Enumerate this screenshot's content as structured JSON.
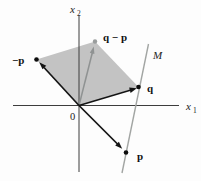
{
  "figure": {
    "labels": {
      "axis_x1": {
        "base": "x",
        "sub": "1"
      },
      "axis_x2": {
        "base": "x",
        "sub": "2"
      },
      "origin": "0",
      "line_m": "M",
      "vector_q": "q",
      "vector_p": "p",
      "vector_minus_p": "−p",
      "vector_q_minus_p": "q − p"
    },
    "colors": {
      "axis": "#3d3d3d",
      "vector": "#141414",
      "region_fill": "#c3c3c3",
      "gray_arrow": "#8f9292",
      "gray_dot": "#9a9d9d",
      "line_m": "#a2a5a3",
      "point": "#0d0d0d"
    }
  }
}
